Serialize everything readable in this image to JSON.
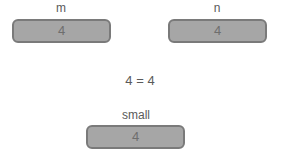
{
  "fields": {
    "m": {
      "label": "m",
      "value": "4"
    },
    "n": {
      "label": "n",
      "value": "4"
    },
    "small": {
      "label": "small",
      "value": "4"
    }
  },
  "comparison": "4 = 4"
}
